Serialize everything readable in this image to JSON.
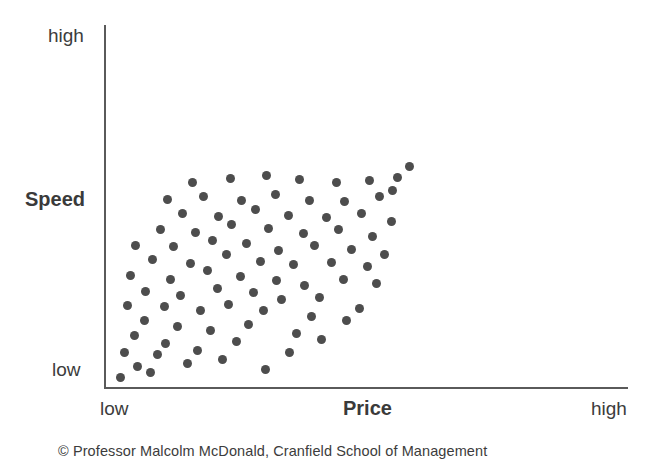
{
  "chart_data": {
    "type": "scatter",
    "title": "",
    "subtitle": "",
    "xlabel": "Price",
    "ylabel": "Speed",
    "x_tick_labels": [
      "low",
      "high"
    ],
    "y_tick_labels": [
      "low",
      "high"
    ],
    "xlim": [
      0,
      100
    ],
    "ylim": [
      0,
      100
    ],
    "grid": false,
    "legend": null,
    "annotations": [],
    "series": [
      {
        "name": "Products",
        "marker": "circle",
        "color": "#4d4d4d",
        "points": [
          [
            4.5,
            3.5
          ],
          [
            9.5,
            8.0
          ],
          [
            13.5,
            5.5
          ],
          [
            5.5,
            13.0
          ],
          [
            15.5,
            12.5
          ],
          [
            24.5,
            9.0
          ],
          [
            35.0,
            10.5
          ],
          [
            48.0,
            6.5
          ],
          [
            8.5,
            19.5
          ],
          [
            18.0,
            16.5
          ],
          [
            27.5,
            14.0
          ],
          [
            39.5,
            17.5
          ],
          [
            55.5,
            13.0
          ],
          [
            11.5,
            25.5
          ],
          [
            21.5,
            23.0
          ],
          [
            31.5,
            21.5
          ],
          [
            43.0,
            24.0
          ],
          [
            57.5,
            20.5
          ],
          [
            65.0,
            18.0
          ],
          [
            6.5,
            31.0
          ],
          [
            17.5,
            30.5
          ],
          [
            28.5,
            29.0
          ],
          [
            37.0,
            31.5
          ],
          [
            47.5,
            29.0
          ],
          [
            62.0,
            27.0
          ],
          [
            72.5,
            25.5
          ],
          [
            12.0,
            36.5
          ],
          [
            22.5,
            35.0
          ],
          [
            33.5,
            37.5
          ],
          [
            44.5,
            36.0
          ],
          [
            53.0,
            33.5
          ],
          [
            64.5,
            34.0
          ],
          [
            76.5,
            30.0
          ],
          [
            7.5,
            42.5
          ],
          [
            19.5,
            41.0
          ],
          [
            30.5,
            44.5
          ],
          [
            40.5,
            42.0
          ],
          [
            51.5,
            40.5
          ],
          [
            60.0,
            38.5
          ],
          [
            71.5,
            41.0
          ],
          [
            81.5,
            39.5
          ],
          [
            14.0,
            48.5
          ],
          [
            25.5,
            47.0
          ],
          [
            36.5,
            50.5
          ],
          [
            46.5,
            48.0
          ],
          [
            56.5,
            46.5
          ],
          [
            68.0,
            47.5
          ],
          [
            79.0,
            46.0
          ],
          [
            9.0,
            54.0
          ],
          [
            20.5,
            53.5
          ],
          [
            32.0,
            56.0
          ],
          [
            42.5,
            54.5
          ],
          [
            52.0,
            52.0
          ],
          [
            63.0,
            54.0
          ],
          [
            74.0,
            52.5
          ],
          [
            84.0,
            50.5
          ],
          [
            16.5,
            60.0
          ],
          [
            27.0,
            59.0
          ],
          [
            38.0,
            62.0
          ],
          [
            49.0,
            60.5
          ],
          [
            59.5,
            58.5
          ],
          [
            70.0,
            60.0
          ],
          [
            80.5,
            57.5
          ],
          [
            23.0,
            66.0
          ],
          [
            34.0,
            65.0
          ],
          [
            45.0,
            67.5
          ],
          [
            55.0,
            65.5
          ],
          [
            66.5,
            64.5
          ],
          [
            77.0,
            66.0
          ],
          [
            86.0,
            63.0
          ],
          [
            18.5,
            71.5
          ],
          [
            29.5,
            72.5
          ],
          [
            41.0,
            71.0
          ],
          [
            51.0,
            73.5
          ],
          [
            61.5,
            71.0
          ],
          [
            72.0,
            70.5
          ],
          [
            82.5,
            72.5
          ],
          [
            26.0,
            78.0
          ],
          [
            37.5,
            79.5
          ],
          [
            48.5,
            80.5
          ],
          [
            58.5,
            79.0
          ],
          [
            69.5,
            78.0
          ],
          [
            79.5,
            78.5
          ],
          [
            88.0,
            80.0
          ],
          [
            86.5,
            75.0
          ],
          [
            91.5,
            84.0
          ]
        ]
      }
    ]
  },
  "axes": {
    "y": {
      "title": "Speed",
      "top_label": "high",
      "bottom_label": "low"
    },
    "x": {
      "title": "Price",
      "left_label": "low",
      "right_label": "high"
    }
  },
  "caption": {
    "text": "© Professor Malcolm McDonald, Cranfield School of Management"
  },
  "colors": {
    "dot": "#4d4d4d",
    "axis": "#5a5a5a",
    "text": "#3c3c3c",
    "background": "#ffffff"
  }
}
